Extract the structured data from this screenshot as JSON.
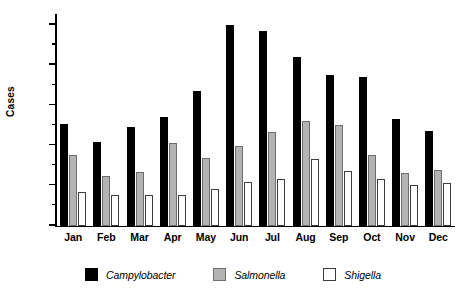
{
  "chart_data": {
    "type": "bar",
    "title": "",
    "xlabel": "",
    "ylabel": "Cases",
    "ylim": [
      0,
      525
    ],
    "yticks": [
      0,
      100,
      200,
      300,
      400,
      500
    ],
    "yminorticks": [
      50,
      150,
      250,
      350,
      450
    ],
    "grid": false,
    "legend_position": "bottom",
    "categories": [
      "Jan",
      "Feb",
      "Mar",
      "Apr",
      "May",
      "Jun",
      "Jul",
      "Aug",
      "Sep",
      "Oct",
      "Nov",
      "Dec"
    ],
    "series": [
      {
        "name": "Campylobacter",
        "color": "#000000",
        "values": [
          252,
          208,
          246,
          270,
          335,
          500,
          483,
          420,
          375,
          370,
          266,
          235
        ]
      },
      {
        "name": "Salmonella",
        "color": "#b3b3b3",
        "values": [
          175,
          122,
          134,
          206,
          168,
          198,
          232,
          260,
          250,
          175,
          130,
          139
        ]
      },
      {
        "name": "Shigella",
        "color": "#ffffff",
        "values": [
          84,
          76,
          75,
          75,
          90,
          108,
          115,
          165,
          135,
          115,
          100,
          105
        ]
      }
    ]
  },
  "legend": {
    "items": [
      {
        "label": "Campylobacter",
        "swatch": "black-square-swatch"
      },
      {
        "label": "Salmonella",
        "swatch": "gray-square-swatch"
      },
      {
        "label": "Shigella",
        "swatch": "white-square-swatch"
      }
    ]
  }
}
